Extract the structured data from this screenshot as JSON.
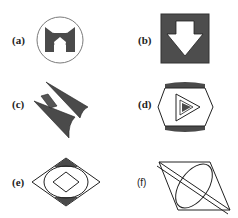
{
  "colors": {
    "fill_dark": "#4a4a4a",
    "stroke": "#222222",
    "circle_stroke": "#777777",
    "background": "#ffffff"
  },
  "figures": [
    {
      "id": "a",
      "label": "(a)",
      "description": "Circle containing a dark cat-face/mask shape with pentagon cutout"
    },
    {
      "id": "b",
      "label": "(b)",
      "description": "Dark square containing a white downward arrow"
    },
    {
      "id": "c",
      "label": "(c)",
      "description": "Two dark elongated tapered spikes with a small dark diamond"
    },
    {
      "id": "d",
      "label": "(d)",
      "description": "Hexagon with dark caps top and bottom containing a nested play triangle"
    },
    {
      "id": "e",
      "label": "(e)",
      "description": "Large diamond with inscribed ellipse, inner diamond, dark corner triangles top and bottom"
    },
    {
      "id": "f",
      "label": "(f)",
      "description": "Parallelogram with tilted ellipse and double diagonal line"
    }
  ]
}
